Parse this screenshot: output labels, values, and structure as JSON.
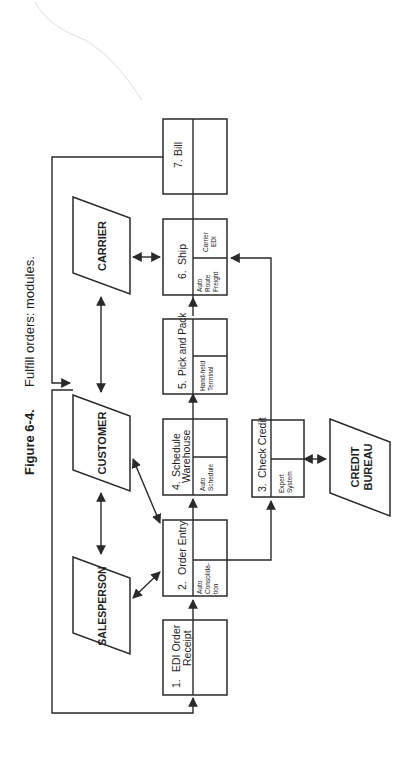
{
  "figure": {
    "label": "Figure 6-4.",
    "caption": "Fulfill orders: modules."
  },
  "modules": [
    {
      "id": 1,
      "number": "1.",
      "title_line1": "EDI Order",
      "title_line2": "Receipt",
      "sub_line1": "",
      "sub_line2": "",
      "sub_line3": ""
    },
    {
      "id": 2,
      "number": "2.",
      "title_line1": "Order Entry",
      "title_line2": "",
      "sub_line1": "Auto",
      "sub_line2": "Consolida-",
      "sub_line3": "tion"
    },
    {
      "id": 3,
      "number": "3.",
      "title_line1": "Check Credit",
      "title_line2": "",
      "sub_line1": "Expert",
      "sub_line2": "System",
      "sub_line3": ""
    },
    {
      "id": 4,
      "number": "4.",
      "title_line1": "Schedule",
      "title_line2": "Warehouse",
      "sub_line1": "Auto",
      "sub_line2": "Schedule",
      "sub_line3": ""
    },
    {
      "id": 5,
      "number": "5.",
      "title_line1": "Pick and Pack",
      "title_line2": "",
      "sub_line1": "Hand-held",
      "sub_line2": "Terminal",
      "sub_line3": ""
    },
    {
      "id": 6,
      "number": "6.",
      "title_line1": "Ship",
      "title_line2": "",
      "sub_line1": "Auto",
      "sub_line2": "Route",
      "sub_line3": "Freight",
      "sub2_line1": "Carrier",
      "sub2_line2": "EDI"
    },
    {
      "id": 7,
      "number": "7.",
      "title_line1": "Bill",
      "title_line2": "",
      "sub_line1": "",
      "sub_line2": "",
      "sub_line3": ""
    }
  ],
  "entities": [
    {
      "id": "salesperson",
      "label": "SALESPERSON"
    },
    {
      "id": "customer",
      "label": "CUSTOMER"
    },
    {
      "id": "carrier",
      "label": "CARRIER"
    },
    {
      "id": "credit_bureau",
      "label_line1": "CREDIT",
      "label_line2": "BUREAU"
    }
  ],
  "connections": [
    {
      "from": "Customer",
      "to": "1. EDI Order Receipt",
      "type": "arrow"
    },
    {
      "from": "1. EDI Order Receipt",
      "to": "2. Order Entry",
      "type": "arrow"
    },
    {
      "from": "2. Order Entry",
      "to": "4. Schedule Warehouse",
      "type": "arrow"
    },
    {
      "from": "4. Schedule Warehouse",
      "to": "5. Pick and Pack",
      "type": "arrow"
    },
    {
      "from": "5. Pick and Pack",
      "to": "6. Ship",
      "type": "arrow"
    },
    {
      "from": "6. Ship",
      "to": "7. Bill",
      "type": "line"
    },
    {
      "from": "7. Bill",
      "to": "Customer",
      "type": "arrow"
    },
    {
      "from": "2. Order Entry",
      "to": "3. Check Credit",
      "type": "arrow"
    },
    {
      "from": "3. Check Credit",
      "to": "6. Ship",
      "type": "arrow"
    },
    {
      "from": "3. Check Credit",
      "to": "Credit Bureau",
      "type": "bidirectional"
    },
    {
      "from": "Salesperson",
      "to": "Customer",
      "type": "bidirectional"
    },
    {
      "from": "Salesperson",
      "to": "2. Order Entry",
      "type": "bidirectional"
    },
    {
      "from": "Customer",
      "to": "2. Order Entry",
      "type": "bidirectional"
    },
    {
      "from": "Customer",
      "to": "Carrier",
      "type": "bidirectional"
    },
    {
      "from": "Carrier",
      "to": "6. Ship",
      "type": "bidirectional"
    }
  ]
}
